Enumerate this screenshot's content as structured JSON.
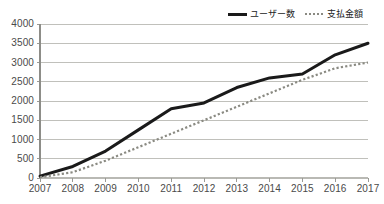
{
  "legend": {
    "position": "top-right",
    "entries": [
      {
        "label": "ユーザー数",
        "style": "solid",
        "color": "#1a1a1a",
        "icon": "solid-line-swatch-icon"
      },
      {
        "label": "支払金額",
        "style": "dotted",
        "color": "#8a8a82",
        "icon": "dotted-line-swatch-icon"
      }
    ]
  },
  "axis": {
    "y_ticks": [
      "4000",
      "3500",
      "3000",
      "2500",
      "2000",
      "1500",
      "1000",
      "500",
      "0"
    ],
    "x_ticks": [
      "2007",
      "2008",
      "2009",
      "2010",
      "2011",
      "2012",
      "2013",
      "2014",
      "2015",
      "2016",
      "2017"
    ]
  },
  "chart_data": {
    "type": "line",
    "title": "",
    "subtitle": "",
    "xlabel": "",
    "ylabel": "",
    "categories": [
      "2007",
      "2008",
      "2009",
      "2010",
      "2011",
      "2012",
      "2013",
      "2014",
      "2015",
      "2016",
      "2017"
    ],
    "x": [
      2007,
      2008,
      2009,
      2010,
      2011,
      2012,
      2013,
      2014,
      2015,
      2016,
      2017
    ],
    "ylim": [
      0,
      4000
    ],
    "ytick_interval": 500,
    "grid": "horizontal",
    "legend_position": "top-right",
    "series": [
      {
        "name": "ユーザー数",
        "style": "solid",
        "color": "#1a1a1a",
        "width": 3,
        "values": [
          50,
          300,
          700,
          1250,
          1800,
          1950,
          2350,
          2600,
          2700,
          3200,
          3500
        ]
      },
      {
        "name": "支払金額",
        "style": "dotted",
        "color": "#8a8a82",
        "width": 2.2,
        "values": [
          20,
          150,
          450,
          800,
          1150,
          1500,
          1850,
          2200,
          2550,
          2850,
          3000
        ]
      }
    ]
  }
}
